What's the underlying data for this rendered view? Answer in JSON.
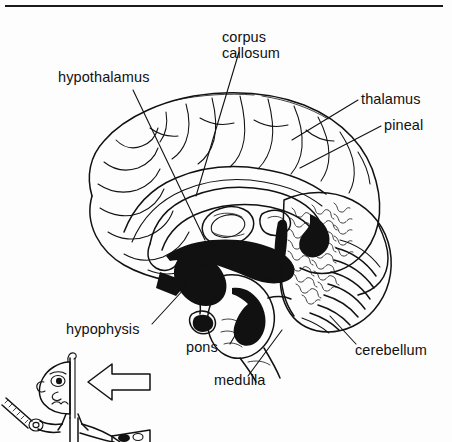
{
  "figure": {
    "kind": "anatomical-line-drawing",
    "top_rule": {
      "present": true,
      "x_start": 5,
      "x_end": 443,
      "y": 6
    },
    "background_color": "#fdfdfd",
    "ink_color": "#111111"
  },
  "labels": [
    {
      "id": "corpus-callosum",
      "text_line1": "corpus",
      "text_line2": "callosum",
      "x": 222,
      "y": 42,
      "align": "start"
    },
    {
      "id": "hypothalamus",
      "text": "hypothalamus",
      "x": 58,
      "y": 82,
      "align": "start"
    },
    {
      "id": "thalamus",
      "text": "thalamus",
      "x": 361,
      "y": 104,
      "align": "start"
    },
    {
      "id": "pineal",
      "text": "pineal",
      "x": 384,
      "y": 130,
      "align": "start"
    },
    {
      "id": "hypophysis",
      "text": "hypophysis",
      "x": 66,
      "y": 334,
      "align": "start"
    },
    {
      "id": "pons",
      "text": "pons",
      "x": 186,
      "y": 352,
      "align": "start"
    },
    {
      "id": "medulla",
      "text": "medulla",
      "x": 214,
      "y": 385,
      "align": "start"
    },
    {
      "id": "cerebellum",
      "text": "cerebellum",
      "x": 355,
      "y": 355,
      "align": "start"
    }
  ],
  "leader_lines": [
    {
      "id": "leader-corpus-callosum",
      "from": [
        239,
        52
      ],
      "to": [
        196,
        196
      ]
    },
    {
      "id": "leader-hypothalamus",
      "from": [
        133,
        90
      ],
      "to": [
        205,
        240
      ]
    },
    {
      "id": "leader-thalamus",
      "from": [
        358,
        100
      ],
      "to": [
        292,
        140
      ]
    },
    {
      "id": "leader-pineal",
      "from": [
        381,
        126
      ],
      "to": [
        300,
        168
      ]
    },
    {
      "id": "leader-hypophysis",
      "from": [
        152,
        324
      ],
      "to": [
        196,
        276
      ]
    },
    {
      "id": "leader-pons",
      "from": [
        230,
        344
      ],
      "to": [
        256,
        300
      ]
    },
    {
      "id": "leader-medulla",
      "from": [
        248,
        376
      ],
      "to": [
        282,
        330
      ]
    },
    {
      "id": "leader-cerebellum",
      "from": [
        356,
        344
      ],
      "to": [
        330,
        316
      ]
    }
  ],
  "regions": [
    {
      "id": "cerebral-cortex",
      "description": "convoluted cerebral hemisphere, gyri and sulci, unshaded outline"
    },
    {
      "id": "corpus-callosum-body",
      "description": "arched band above lateral ventricle"
    },
    {
      "id": "lateral-ventricle",
      "description": "dark filled crescent beneath corpus callosum"
    },
    {
      "id": "thalamus-body",
      "description": "oval mass at center of brain"
    },
    {
      "id": "pineal-body",
      "description": "small nodule posterior to thalamus"
    },
    {
      "id": "hypothalamus-body",
      "description": "region below thalamus, above pituitary stalk"
    },
    {
      "id": "hypophysis-body",
      "description": "pituitary gland on stalk, antero-inferior"
    },
    {
      "id": "pons-body",
      "description": "rounded bulge of brainstem"
    },
    {
      "id": "medulla-body",
      "description": "tapering lower brainstem"
    },
    {
      "id": "cerebellum-body",
      "description": "densely textured arbor-vitae mass, posterior-inferior"
    }
  ],
  "cartoon": {
    "id": "cartoon-figure",
    "description": "cartoon man with sawn-open head holding a saw",
    "parts": [
      {
        "id": "head-profile",
        "description": "half head in profile, cut vertically"
      },
      {
        "id": "eye",
        "description": "single eye"
      },
      {
        "id": "ear",
        "description": "ear at left of head"
      },
      {
        "id": "nose",
        "description": "small nose"
      },
      {
        "id": "hair-tuft",
        "description": "single hair curl on top of head"
      },
      {
        "id": "saw",
        "description": "hand saw with toothed blade"
      },
      {
        "id": "arm",
        "description": "arm holding saw"
      },
      {
        "id": "body",
        "description": "narrow torso with collar"
      },
      {
        "id": "table",
        "description": "table edge at lower right of figure"
      }
    ]
  },
  "arrow": {
    "id": "pointer-arrow",
    "direction": "left",
    "style": "outline",
    "x": 88,
    "y": 366,
    "width": 62,
    "height": 32
  }
}
